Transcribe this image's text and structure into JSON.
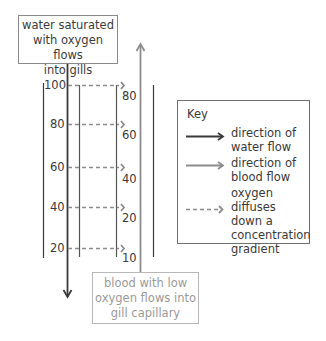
{
  "diagram": {
    "top_label": [
      "water saturated",
      "with oxygen flows",
      "into gills"
    ],
    "bottom_label": [
      "blood with low",
      "oxygen flows into",
      "gill capillary"
    ],
    "water_oxygen_values": [
      "100",
      "80",
      "60",
      "40",
      "20"
    ],
    "blood_oxygen_values": [
      "80",
      "60",
      "40",
      "20",
      "10"
    ],
    "colors": {
      "water_flow": "#3a3a3a",
      "blood_flow": "#8c8c8c",
      "diffusion": "#8c8c8c"
    }
  },
  "key": {
    "title": "Key",
    "items": [
      {
        "icon": "dark-arrow-icon",
        "label": [
          "direction of",
          "water flow"
        ]
      },
      {
        "icon": "gray-arrow-icon",
        "label": [
          "direction of",
          "blood flow"
        ]
      },
      {
        "icon": "dashed-arrow-icon",
        "label": [
          "oxygen diffuses",
          "down a",
          "concentration",
          "gradient"
        ]
      }
    ]
  }
}
